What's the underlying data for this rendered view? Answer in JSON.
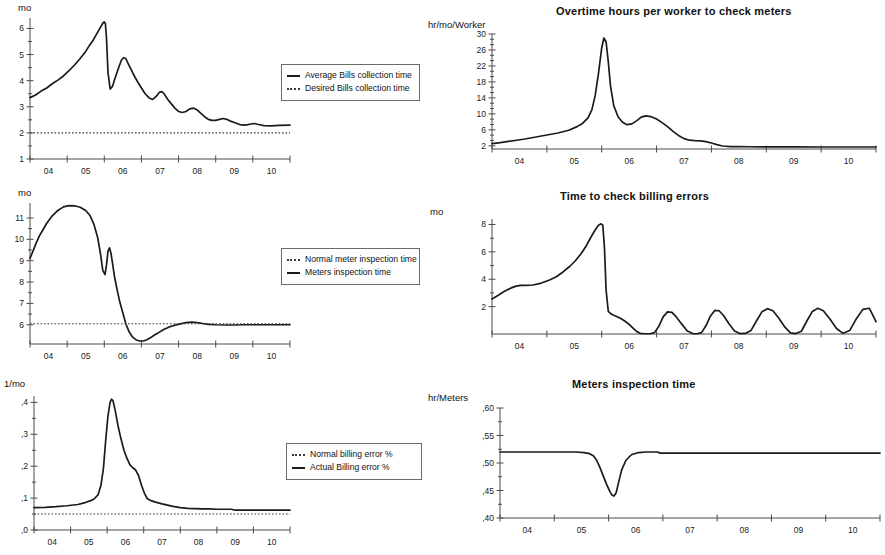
{
  "page": {
    "background": "#ffffff",
    "line_color": "#1b1b1b",
    "axis_color": "#4a4a4a"
  },
  "xaxis": {
    "tick_labels": [
      "04",
      "05",
      "06",
      "07",
      "08",
      "09",
      "10"
    ],
    "range": [
      3.5,
      10.5
    ]
  },
  "panels": {
    "bills_collection": {
      "title": "",
      "unit": "mo",
      "legend": [
        {
          "label": "Average Bills collection time",
          "style": "solid"
        },
        {
          "label": "Desired Bills collection time",
          "style": "dotted"
        }
      ]
    },
    "overtime_hours": {
      "title": "Overtime hours per worker to check meters",
      "unit": "hr/mo/Worker",
      "legend": []
    },
    "meters_inspection_legend": {
      "title": "",
      "unit": "mo",
      "legend": [
        {
          "label": "Normal meter inspection time",
          "style": "dotted"
        },
        {
          "label": "Meters inspection time",
          "style": "solid"
        }
      ]
    },
    "billing_errors_time": {
      "title": "Time to check billing errors",
      "unit": "mo",
      "legend": []
    },
    "billing_error_pct": {
      "title": "",
      "unit": "1/mo",
      "legend": [
        {
          "label": "Normal billing error  %",
          "style": "dotted"
        },
        {
          "label": "Actual Billing error %",
          "style": "solid"
        }
      ]
    },
    "meters_inspection_time": {
      "title": "Meters inspection time",
      "unit": "hr/Meters",
      "legend": []
    }
  },
  "chart_data": [
    {
      "id": "bills_collection",
      "type": "line",
      "title": "",
      "xlabel": "",
      "ylabel": "mo",
      "xlim": [
        3.5,
        10.5
      ],
      "ylim": [
        1,
        6.4
      ],
      "yticks": [
        1,
        2,
        3,
        4,
        5,
        6
      ],
      "ytick_labels": [
        "1",
        "2",
        "3",
        "4",
        "5",
        "6"
      ],
      "xticks": [
        4,
        5,
        6,
        7,
        8,
        9,
        10
      ],
      "xtick_labels": [
        "04",
        "05",
        "06",
        "07",
        "08",
        "09",
        "10"
      ],
      "grid": false,
      "legend_position": "right",
      "series": [
        {
          "name": "Average Bills collection time",
          "style": "solid",
          "x": [
            3.5,
            3.65,
            3.8,
            3.95,
            4.1,
            4.25,
            4.4,
            4.55,
            4.7,
            4.85,
            5.0,
            5.1,
            5.2,
            5.3,
            5.4,
            5.47,
            5.5,
            5.53,
            5.56,
            5.6,
            5.66,
            5.72,
            5.78,
            5.84,
            5.9,
            5.96,
            6.02,
            6.08,
            6.12,
            6.18,
            6.25,
            6.32,
            6.4,
            6.5,
            6.6,
            6.7,
            6.8,
            6.9,
            6.98,
            7.05,
            7.12,
            7.2,
            7.3,
            7.4,
            7.5,
            7.6,
            7.7,
            7.8,
            7.9,
            8.0,
            8.1,
            8.2,
            8.3,
            8.4,
            8.5,
            8.6,
            8.7,
            8.8,
            8.9,
            9.0,
            9.15,
            9.3,
            9.45,
            9.55,
            9.65,
            9.8,
            10.0,
            10.2,
            10.5
          ],
          "y": [
            3.35,
            3.45,
            3.6,
            3.72,
            3.88,
            4.02,
            4.18,
            4.38,
            4.6,
            4.85,
            5.12,
            5.35,
            5.55,
            5.8,
            6.05,
            6.22,
            6.25,
            6.18,
            5.62,
            4.3,
            3.68,
            3.78,
            4.05,
            4.3,
            4.55,
            4.78,
            4.88,
            4.85,
            4.72,
            4.55,
            4.35,
            4.15,
            3.95,
            3.72,
            3.5,
            3.35,
            3.28,
            3.4,
            3.55,
            3.58,
            3.48,
            3.3,
            3.12,
            2.95,
            2.82,
            2.78,
            2.82,
            2.92,
            2.95,
            2.88,
            2.75,
            2.62,
            2.52,
            2.48,
            2.48,
            2.52,
            2.55,
            2.52,
            2.45,
            2.4,
            2.32,
            2.3,
            2.34,
            2.36,
            2.32,
            2.28,
            2.27,
            2.29,
            2.3
          ]
        },
        {
          "name": "Desired Bills collection time",
          "style": "dotted",
          "x": [
            3.5,
            10.5
          ],
          "y": [
            2.0,
            2.0
          ]
        }
      ]
    },
    {
      "id": "overtime_hours",
      "type": "line",
      "title": "Overtime hours per worker to check meters",
      "xlabel": "",
      "ylabel": "hr/mo/Worker",
      "xlim": [
        3.5,
        10.5
      ],
      "ylim": [
        1.2,
        30
      ],
      "yticks": [
        2,
        6,
        10,
        14,
        18,
        22,
        26,
        30
      ],
      "ytick_labels": [
        "2",
        "6",
        "10",
        "14",
        "18",
        "22",
        "26",
        "30"
      ],
      "xticks": [
        4,
        5,
        6,
        7,
        8,
        9,
        10
      ],
      "xtick_labels": [
        "04",
        "05",
        "06",
        "07",
        "08",
        "09",
        "10"
      ],
      "grid": false,
      "legend_position": "none",
      "series": [
        {
          "name": "Overtime hours per worker to check meters",
          "style": "solid",
          "x": [
            3.5,
            3.65,
            3.8,
            3.95,
            4.1,
            4.3,
            4.5,
            4.7,
            4.9,
            5.05,
            5.15,
            5.25,
            5.32,
            5.38,
            5.44,
            5.5,
            5.54,
            5.58,
            5.62,
            5.66,
            5.72,
            5.8,
            5.88,
            5.96,
            6.05,
            6.14,
            6.22,
            6.3,
            6.4,
            6.5,
            6.6,
            6.7,
            6.8,
            6.9,
            7.0,
            7.1,
            7.2,
            7.3,
            7.4,
            7.5,
            7.6,
            7.7,
            7.85,
            8.0,
            8.2,
            8.5,
            9.0,
            9.5,
            10.0,
            10.5
          ],
          "y": [
            2.55,
            2.8,
            3.1,
            3.4,
            3.7,
            4.2,
            4.7,
            5.2,
            5.9,
            6.8,
            7.6,
            9.0,
            11.0,
            14.5,
            20.0,
            26.5,
            29.0,
            28.0,
            23.0,
            17.0,
            12.0,
            9.2,
            7.9,
            7.3,
            7.5,
            8.3,
            9.2,
            9.5,
            9.3,
            8.7,
            7.8,
            6.8,
            5.6,
            4.6,
            3.8,
            3.4,
            3.3,
            3.25,
            3.05,
            2.7,
            2.3,
            1.95,
            1.8,
            1.78,
            1.76,
            1.74,
            1.72,
            1.7,
            1.7,
            1.7
          ]
        }
      ]
    },
    {
      "id": "meters_inspection_legend",
      "type": "line",
      "title": "",
      "xlabel": "",
      "ylabel": "mo",
      "xlim": [
        3.5,
        10.5
      ],
      "ylim": [
        5.1,
        11.7
      ],
      "yticks": [
        6,
        7,
        8,
        9,
        10,
        11
      ],
      "ytick_labels": [
        "6",
        "7",
        "8",
        "9",
        "10",
        "11"
      ],
      "xticks": [
        4,
        5,
        6,
        7,
        8,
        9,
        10
      ],
      "xtick_labels": [
        "04",
        "05",
        "06",
        "07",
        "08",
        "09",
        "10"
      ],
      "grid": false,
      "legend_position": "right",
      "series": [
        {
          "name": "Meters inspection time",
          "style": "solid",
          "x": [
            3.5,
            3.58,
            3.66,
            3.75,
            3.85,
            3.95,
            4.1,
            4.25,
            4.4,
            4.55,
            4.7,
            4.85,
            5.0,
            5.12,
            5.22,
            5.32,
            5.4,
            5.46,
            5.52,
            5.56,
            5.6,
            5.64,
            5.68,
            5.72,
            5.78,
            5.85,
            5.92,
            6.0,
            6.08,
            6.16,
            6.25,
            6.35,
            6.45,
            6.55,
            6.65,
            6.75,
            6.85,
            6.95,
            7.1,
            7.25,
            7.4,
            7.55,
            7.7,
            7.85,
            8.0,
            8.15,
            8.3,
            8.5,
            8.75,
            9.0,
            9.3,
            9.6,
            10.0,
            10.5
          ],
          "y": [
            9.1,
            9.45,
            9.8,
            10.15,
            10.45,
            10.75,
            11.1,
            11.35,
            11.52,
            11.58,
            11.57,
            11.5,
            11.35,
            11.1,
            10.7,
            10.1,
            9.3,
            8.55,
            8.35,
            8.8,
            9.45,
            9.6,
            9.35,
            8.9,
            8.2,
            7.6,
            7.05,
            6.55,
            6.05,
            5.7,
            5.45,
            5.3,
            5.24,
            5.24,
            5.3,
            5.4,
            5.52,
            5.62,
            5.78,
            5.9,
            5.98,
            6.04,
            6.1,
            6.12,
            6.1,
            6.06,
            6.02,
            6.0,
            5.99,
            5.99,
            6.0,
            6.0,
            6.0,
            6.0
          ]
        },
        {
          "name": "Normal meter inspection time",
          "style": "dotted",
          "x": [
            3.5,
            10.5
          ],
          "y": [
            6.05,
            6.05
          ]
        }
      ]
    },
    {
      "id": "billing_errors_time",
      "type": "line",
      "title": "Time to check billing errors",
      "xlabel": "",
      "ylabel": "mo",
      "xlim": [
        3.5,
        10.5
      ],
      "ylim": [
        0,
        8.4
      ],
      "yticks": [
        2,
        4,
        6,
        8
      ],
      "ytick_labels": [
        "2",
        "4",
        "6",
        "8"
      ],
      "xticks": [
        4,
        5,
        6,
        7,
        8,
        9,
        10
      ],
      "xtick_labels": [
        "04",
        "05",
        "06",
        "07",
        "08",
        "09",
        "10"
      ],
      "grid": false,
      "legend_position": "none",
      "series": [
        {
          "name": "Time to check billing errors",
          "style": "solid",
          "x": [
            3.5,
            3.6,
            3.72,
            3.84,
            3.94,
            4.02,
            4.12,
            4.25,
            4.4,
            4.55,
            4.68,
            4.8,
            4.92,
            5.02,
            5.12,
            5.22,
            5.3,
            5.38,
            5.44,
            5.49,
            5.52,
            5.55,
            5.58,
            5.62,
            5.66,
            5.7,
            5.76,
            5.84,
            5.92,
            6.0,
            6.08,
            6.14,
            6.2,
            6.28,
            6.38,
            6.46,
            6.54,
            6.62,
            6.7,
            6.78,
            6.86,
            6.96,
            7.06,
            7.16,
            7.24,
            7.32,
            7.4,
            7.48,
            7.56,
            7.64,
            7.72,
            7.82,
            7.92,
            8.02,
            8.12,
            8.22,
            8.32,
            8.42,
            8.52,
            8.62,
            8.72,
            8.84,
            8.94,
            9.04,
            9.14,
            9.24,
            9.34,
            9.44,
            9.54,
            9.66,
            9.78,
            9.9,
            10.02,
            10.14,
            10.26,
            10.38,
            10.5
          ],
          "y": [
            2.55,
            2.8,
            3.1,
            3.35,
            3.5,
            3.55,
            3.55,
            3.58,
            3.72,
            3.95,
            4.2,
            4.55,
            4.95,
            5.35,
            5.85,
            6.45,
            7.05,
            7.6,
            7.95,
            8.05,
            7.95,
            6.3,
            3.2,
            1.65,
            1.5,
            1.4,
            1.3,
            1.15,
            0.95,
            0.7,
            0.4,
            0.18,
            0.05,
            0.02,
            0.02,
            0.1,
            0.55,
            1.25,
            1.62,
            1.58,
            1.25,
            0.72,
            0.22,
            0.03,
            0.02,
            0.1,
            0.6,
            1.3,
            1.72,
            1.7,
            1.35,
            0.75,
            0.22,
            0.03,
            0.04,
            0.25,
            0.95,
            1.62,
            1.85,
            1.7,
            1.2,
            0.5,
            0.08,
            0.03,
            0.2,
            0.95,
            1.65,
            1.88,
            1.7,
            1.1,
            0.4,
            0.05,
            0.25,
            1.1,
            1.8,
            1.88,
            0.9
          ]
        }
      ]
    },
    {
      "id": "billing_error_pct",
      "type": "line",
      "title": "",
      "xlabel": "",
      "ylabel": "1/mo",
      "xlim": [
        3.5,
        10.5
      ],
      "ylim": [
        0,
        0.42
      ],
      "yticks": [
        0,
        0.1,
        0.2,
        0.3,
        0.4
      ],
      "ytick_labels": [
        ",0",
        ",1",
        ",2",
        ",3",
        ",4"
      ],
      "xticks": [
        4,
        5,
        6,
        7,
        8,
        9,
        10
      ],
      "xtick_labels": [
        "04",
        "05",
        "06",
        "07",
        "08",
        "09",
        "10"
      ],
      "grid": false,
      "legend_position": "right",
      "series": [
        {
          "name": "Actual Billing error %",
          "style": "solid",
          "x": [
            3.5,
            3.8,
            4.1,
            4.4,
            4.7,
            4.9,
            5.05,
            5.15,
            5.25,
            5.33,
            5.4,
            5.46,
            5.52,
            5.58,
            5.62,
            5.66,
            5.72,
            5.8,
            5.88,
            5.96,
            6.04,
            6.12,
            6.2,
            6.28,
            6.36,
            6.44,
            6.52,
            6.6,
            6.7,
            6.8,
            6.9,
            7.0,
            7.15,
            7.3,
            7.5,
            7.7,
            7.9,
            8.1,
            8.3,
            8.5,
            8.7,
            8.9,
            9.0,
            9.2,
            9.5,
            9.8,
            10.1,
            10.5
          ],
          "y": [
            0.07,
            0.071,
            0.073,
            0.076,
            0.08,
            0.086,
            0.092,
            0.098,
            0.11,
            0.14,
            0.195,
            0.28,
            0.355,
            0.4,
            0.41,
            0.405,
            0.375,
            0.325,
            0.285,
            0.25,
            0.225,
            0.205,
            0.195,
            0.188,
            0.17,
            0.14,
            0.115,
            0.098,
            0.092,
            0.088,
            0.085,
            0.082,
            0.078,
            0.074,
            0.07,
            0.068,
            0.067,
            0.066,
            0.066,
            0.065,
            0.065,
            0.065,
            0.062,
            0.062,
            0.062,
            0.062,
            0.062,
            0.062
          ]
        },
        {
          "name": "Normal billing error  %",
          "style": "dotted",
          "x": [
            3.5,
            10.5
          ],
          "y": [
            0.05,
            0.05
          ]
        }
      ]
    },
    {
      "id": "meters_inspection_time",
      "type": "line",
      "title": "Meters inspection time",
      "xlabel": "",
      "ylabel": "hr/Meters",
      "xlim": [
        3.5,
        10.5
      ],
      "ylim": [
        0.4,
        0.6
      ],
      "yticks": [
        0.4,
        0.45,
        0.5,
        0.55,
        0.6
      ],
      "ytick_labels": [
        ",40",
        ",45",
        ",50",
        ",55",
        ",60"
      ],
      "xticks": [
        4,
        5,
        6,
        7,
        8,
        9,
        10
      ],
      "xtick_labels": [
        "04",
        "05",
        "06",
        "07",
        "08",
        "09",
        "10"
      ],
      "grid": false,
      "legend_position": "none",
      "series": [
        {
          "name": "Meters inspection time",
          "style": "solid",
          "x": [
            3.5,
            4.0,
            4.5,
            4.9,
            5.05,
            5.15,
            5.22,
            5.28,
            5.34,
            5.4,
            5.46,
            5.52,
            5.56,
            5.6,
            5.64,
            5.68,
            5.74,
            5.82,
            5.92,
            6.05,
            6.2,
            6.4,
            6.45,
            6.6,
            7.0,
            7.5,
            8.0,
            8.5,
            9.0,
            9.5,
            10.0,
            10.5
          ],
          "y": [
            0.52,
            0.52,
            0.52,
            0.52,
            0.519,
            0.517,
            0.513,
            0.505,
            0.492,
            0.477,
            0.462,
            0.449,
            0.442,
            0.44,
            0.446,
            0.463,
            0.487,
            0.505,
            0.515,
            0.519,
            0.52,
            0.52,
            0.518,
            0.518,
            0.518,
            0.518,
            0.518,
            0.518,
            0.518,
            0.518,
            0.518,
            0.518
          ]
        }
      ]
    }
  ]
}
